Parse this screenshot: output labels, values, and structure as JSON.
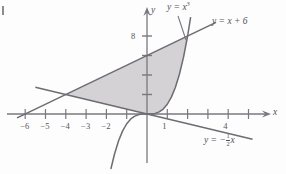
{
  "figure": {
    "colors": {
      "axis": "#7a787e",
      "curve": "#6e6c72",
      "shade_fill": "#d4d2d4",
      "text": "#56545a",
      "background": "#fdfdfd"
    }
  },
  "axes": {
    "x_axis_label": "x",
    "y_axis_label": "y",
    "origin_px": {
      "x": 147,
      "y": 114
    },
    "x_scale_px_per_unit": 20.3,
    "y_scale_px_per_unit": 9.75,
    "x_range": [
      -6.9,
      6.2
    ],
    "y_range": [
      -6.2,
      11.5
    ],
    "x_ticks": [
      -6,
      -5,
      -4,
      -3,
      -2,
      -1,
      1,
      2,
      3,
      4,
      5
    ],
    "x_tick_labels": [
      {
        "value": -6,
        "text": "−6"
      },
      {
        "value": -5,
        "text": "−5"
      },
      {
        "value": -4,
        "text": "−4"
      },
      {
        "value": -3,
        "text": "−3"
      },
      {
        "value": -2,
        "text": "−2"
      },
      {
        "value": 1,
        "text": "1"
      },
      {
        "value": 4,
        "text": "4"
      }
    ],
    "y_ticks": [
      2,
      4,
      6,
      8
    ],
    "y_tick_labels": [
      {
        "value": 8,
        "text": "8"
      }
    ],
    "grid": false
  },
  "chart_data": {
    "type": "line",
    "title": "",
    "xlabel": "x",
    "ylabel": "y",
    "xlim": [
      -6.9,
      6.2
    ],
    "ylim": [
      -6.2,
      11.5
    ],
    "grid": false,
    "legend_position": "inline-curve-labels",
    "series": [
      {
        "name": "y = x^3",
        "label": "y = x³",
        "equation": "y = x^3",
        "color": "#6e6c72",
        "x": [
          -1.78,
          -1.6,
          -1.4,
          -1.2,
          -1.0,
          -0.8,
          -0.6,
          -0.4,
          -0.2,
          0,
          0.2,
          0.4,
          0.6,
          0.8,
          1.0,
          1.2,
          1.4,
          1.6,
          1.8,
          2.0,
          2.15
        ],
        "y": [
          -5.64,
          -4.1,
          -2.74,
          -1.73,
          -1.0,
          -0.51,
          -0.22,
          -0.06,
          -0.01,
          0,
          0.01,
          0.06,
          0.22,
          0.51,
          1.0,
          1.73,
          2.74,
          4.1,
          5.83,
          8.0,
          9.94
        ]
      },
      {
        "name": "y = x + 6",
        "label": "y = x + 6",
        "equation": "y = x + 6",
        "color": "#6e6c72",
        "x": [
          -6.4,
          3.4
        ],
        "y": [
          -0.4,
          9.4
        ]
      },
      {
        "name": "y = -x/2",
        "label": "y = -1/2 x",
        "equation": "y = -(1/2)x",
        "color": "#6e6c72",
        "x": [
          -5.5,
          5.2
        ],
        "y": [
          2.75,
          -2.6
        ]
      }
    ],
    "shaded_region": {
      "fill": "#d4d2d4",
      "description": "Region bounded above by y = x + 6, below-left by y = -x/2, and right by y = x^3",
      "vertices": [
        {
          "x": -4,
          "y": 2,
          "note": "intersection of y = x + 6 and y = -x/2"
        },
        {
          "x": 2,
          "y": 8,
          "note": "intersection of y = x + 6 and y = x^3"
        },
        {
          "x": 0,
          "y": 0,
          "note": "intersection of y = x^3 and y = -x/2"
        }
      ]
    },
    "annotations": [
      {
        "text": "y = x³",
        "x_px": 168,
        "y_px": 5
      },
      {
        "text": "y = x + 6",
        "x_px": 213,
        "y_px": 18
      },
      {
        "text": "y = -½x",
        "x_px": 205,
        "y_px": 136
      }
    ]
  },
  "labels": {
    "cubic": {
      "prefix": "y = x",
      "exponent": "3"
    },
    "line_sum": "y = x + 6",
    "line_half": {
      "prefix": "y = −",
      "num": "1",
      "den": "2",
      "suffix": "x"
    },
    "axis_x": "x",
    "axis_y": "y"
  }
}
